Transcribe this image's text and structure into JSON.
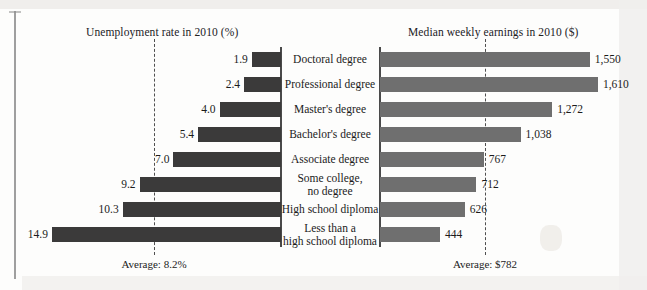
{
  "figure": {
    "left_panel_title": "Unemployment rate in 2010 (%)",
    "right_panel_title": "Median weekly earnings in 2010 ($)",
    "left_average_caption": "Average: 8.2%",
    "right_average_caption": "Average: $782",
    "bar_color_left": "#3b3a3a",
    "bar_color_right": "#6f6f6f",
    "axis_color": "#4a4a4a"
  },
  "chart_data": {
    "type": "bar",
    "orientation": "horizontal-diverging",
    "categories": [
      "Doctoral degree",
      "Professional degree",
      "Master's degree",
      "Bachelor's degree",
      "Associate degree",
      "Some college,\nno degree",
      "High school diploma",
      "Less than a\nhigh school diploma"
    ],
    "category_lines": [
      [
        "Doctoral degree"
      ],
      [
        "Professional degree"
      ],
      [
        "Master's degree"
      ],
      [
        "Bachelor's degree"
      ],
      [
        "Associate degree"
      ],
      [
        "Some college,",
        "no degree"
      ],
      [
        "High school diploma"
      ],
      [
        "Less than a",
        "high school diploma"
      ]
    ],
    "series": [
      {
        "name": "Unemployment rate in 2010 (%)",
        "side": "left",
        "unit": "%",
        "values": [
          1.9,
          2.4,
          4.0,
          5.4,
          7.0,
          9.2,
          10.3,
          14.9
        ],
        "labels": [
          "1.9",
          "2.4",
          "4.0",
          "5.4",
          "7.0",
          "9.2",
          "10.3",
          "14.9"
        ],
        "average": 8.2,
        "average_label": "Average: 8.2%",
        "xlim": [
          0,
          14.9
        ],
        "color": "#3b3a3a"
      },
      {
        "name": "Median weekly earnings in 2010 ($)",
        "side": "right",
        "unit": "$",
        "values": [
          1550,
          1610,
          1272,
          1038,
          767,
          712,
          626,
          444
        ],
        "labels": [
          "1,550",
          "1,610",
          "1,272",
          "1,038",
          "767",
          "712",
          "626",
          "444"
        ],
        "average": 782,
        "average_label": "Average: $782",
        "xlim": [
          0,
          1610
        ],
        "color": "#6f6f6f"
      }
    ],
    "grid": false,
    "legend": "none",
    "xlabel": "",
    "ylabel": ""
  }
}
